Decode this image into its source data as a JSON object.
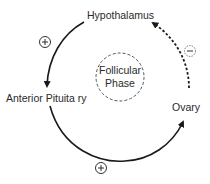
{
  "diagram": {
    "nodes": {
      "hypothalamus": "Hypothalamus",
      "anterior_pituitary": "Anterior Pituita ry",
      "ovary": "Ovary"
    },
    "center": {
      "line1": "Follicular",
      "line2": "Phase"
    },
    "edges": [
      {
        "from": "Hypothalamus",
        "to": "Anterior Pituitary",
        "style": "solid",
        "sign": "+"
      },
      {
        "from": "Anterior Pituitary",
        "to": "Ovary",
        "style": "solid",
        "sign": "+"
      },
      {
        "from": "Ovary",
        "to": "Hypothalamus",
        "style": "dashed",
        "sign": "−"
      }
    ],
    "signs": {
      "hyp_to_ap": "+",
      "ap_to_ovary": "+",
      "ovary_to_hyp": "−"
    },
    "colors": {
      "line": "#1a1a1a",
      "text": "#2a2a2a",
      "dashed_circle": "#666666"
    }
  }
}
